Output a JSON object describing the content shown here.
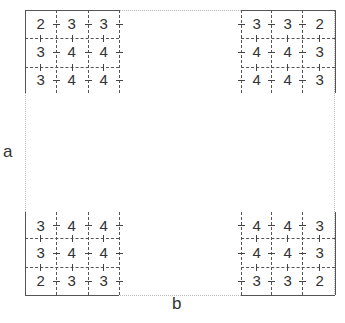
{
  "diagram": {
    "labels": {
      "left": "a",
      "bottom": "b"
    },
    "grids": {
      "top_left": {
        "rows": [
          [
            "2",
            "3",
            "3"
          ],
          [
            "3",
            "4",
            "4"
          ],
          [
            "3",
            "4",
            "4"
          ]
        ]
      },
      "top_right": {
        "rows": [
          [
            "3",
            "3",
            "2"
          ],
          [
            "4",
            "4",
            "3"
          ],
          [
            "4",
            "4",
            "3"
          ]
        ]
      },
      "bottom_left": {
        "rows": [
          [
            "3",
            "4",
            "4"
          ],
          [
            "3",
            "4",
            "4"
          ],
          [
            "2",
            "3",
            "3"
          ]
        ]
      },
      "bottom_right": {
        "rows": [
          [
            "4",
            "4",
            "3"
          ],
          [
            "4",
            "4",
            "3"
          ],
          [
            "3",
            "3",
            "2"
          ]
        ]
      }
    },
    "colors": {
      "line": "#555555",
      "frame": "#b8b8b8",
      "text": "#333333"
    }
  }
}
